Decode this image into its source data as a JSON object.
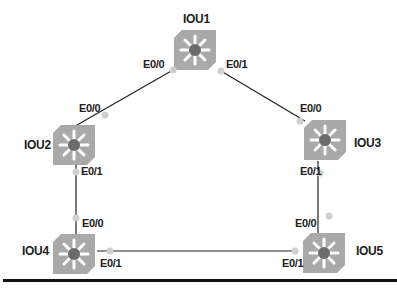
{
  "devices": [
    {
      "id": "IOU1",
      "label": "IOU1"
    },
    {
      "id": "IOU2",
      "label": "IOU2"
    },
    {
      "id": "IOU3",
      "label": "IOU3"
    },
    {
      "id": "IOU4",
      "label": "IOU4"
    },
    {
      "id": "IOU5",
      "label": "IOU5"
    }
  ],
  "interfaces": {
    "iou1_e00": "E0/0",
    "iou1_e01": "E0/1",
    "iou2_e00": "E0/0",
    "iou2_e01": "E0/1",
    "iou3_e00": "E0/0",
    "iou3_e01": "E0/1",
    "iou4_e00": "E0/0",
    "iou4_e01": "E0/1",
    "iou5_e00": "E0/0",
    "iou5_e01": "E0/1"
  },
  "links": [
    {
      "from": "IOU1:E0/0",
      "to": "IOU2:E0/0"
    },
    {
      "from": "IOU1:E0/1",
      "to": "IOU3:E0/0"
    },
    {
      "from": "IOU2:E0/1",
      "to": "IOU4:E0/0"
    },
    {
      "from": "IOU3:E0/1",
      "to": "IOU5:E0/0"
    },
    {
      "from": "IOU4:E0/1",
      "to": "IOU5:E0/1"
    }
  ],
  "colors": {
    "device": "#a9a9a9",
    "center": "#6b6b6b",
    "link": "#222222",
    "port": "#cfcfcf"
  }
}
